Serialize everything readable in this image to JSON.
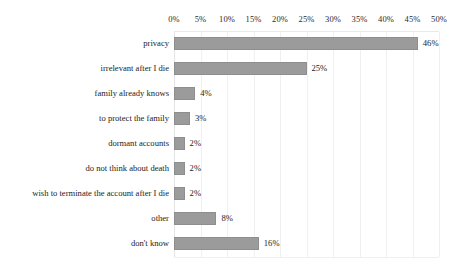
{
  "chart_data": {
    "type": "bar",
    "orientation": "horizontal",
    "title": "",
    "subtitle": "",
    "xlabel": "",
    "ylabel": "",
    "xlim": [
      0,
      50
    ],
    "xtick_step": 5,
    "grid": true,
    "legend": "none",
    "value_suffix": "%",
    "xticks": [
      {
        "label": "0%",
        "value": 0
      },
      {
        "label": "5%",
        "value": 5
      },
      {
        "label": "10%",
        "value": 10
      },
      {
        "label": "15%",
        "value": 15
      },
      {
        "label": "20%",
        "value": 20
      },
      {
        "label": "25%",
        "value": 25
      },
      {
        "label": "30%",
        "value": 30
      },
      {
        "label": "35%",
        "value": 35
      },
      {
        "label": "40%",
        "value": 40
      },
      {
        "label": "45%",
        "value": 45
      },
      {
        "label": "50%",
        "value": 50
      }
    ],
    "categories": [
      "privacy",
      "irrelevant after I die",
      "family already knows",
      "to protect the family",
      "dormant accounts",
      "do not think about death",
      "wish to terminate the account after I die",
      "other",
      "don't know"
    ],
    "values": [
      46,
      25,
      4,
      3,
      2,
      2,
      2,
      8,
      16
    ],
    "data_labels": [
      "46%",
      "25%",
      "4%",
      "3%",
      "2%",
      "2%",
      "2%",
      "8%",
      "16%"
    ],
    "bar_color": "#9b9b9b",
    "grid_color": "#f0f0f0",
    "text_color": "#1c1c1c",
    "background": "#ffffff"
  }
}
